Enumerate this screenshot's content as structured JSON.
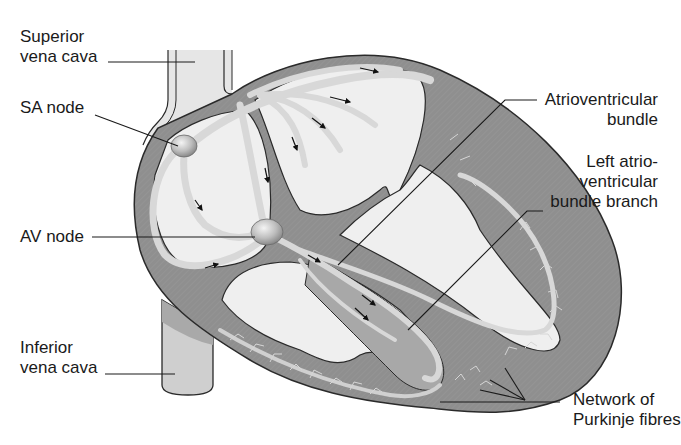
{
  "diagram": {
    "colors": {
      "background": "#ffffff",
      "myocardium": "#8f8f8f",
      "chamber": "#efefef",
      "conduction_path": "#d8d8d8",
      "vessel": "#cfcfcf",
      "outline": "#2a2a2a",
      "leader_line": "#1a1a1a",
      "label_text": "#1a1a1a"
    },
    "labels": {
      "superior_vena_cava": {
        "line1": "Superior",
        "line2": "vena cava"
      },
      "sa_node": {
        "line1": "SA node"
      },
      "av_node": {
        "line1": "AV node"
      },
      "inferior_vena_cava": {
        "line1": "Inferior",
        "line2": "vena cava"
      },
      "atrioventricular_bundle": {
        "line1": "Atrioventricular",
        "line2": "bundle"
      },
      "left_av_bundle_branch": {
        "line1": "Left atrio-",
        "line2": "ventricular",
        "line3": "bundle branch"
      },
      "purkinje_fibres": {
        "line1": "Network of",
        "line2": "Purkinje fibres"
      }
    },
    "structures": [
      "superior-vena-cava",
      "inferior-vena-cava",
      "sa-node",
      "av-node",
      "atrioventricular-bundle",
      "left-bundle-branch",
      "right-bundle-branch",
      "purkinje-fibres",
      "interatrial-pathways",
      "conduction-arrows"
    ]
  }
}
